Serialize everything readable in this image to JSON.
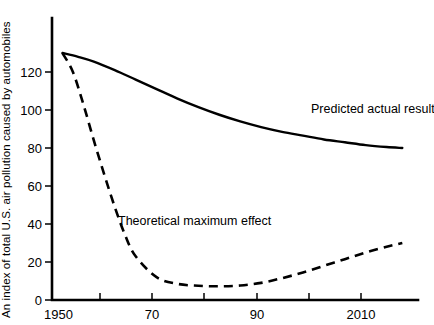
{
  "chart_data": {
    "type": "line",
    "title": "",
    "xlabel": "",
    "ylabel": "An index of total U.S. air pollution caused by automobiles",
    "xlim": [
      1950,
      2020
    ],
    "ylim": [
      0,
      140
    ],
    "grid": false,
    "legend_position": "inline-annotation",
    "x_ticks": [
      {
        "value": 1950,
        "label": "1950"
      },
      {
        "value": 1960,
        "label": ""
      },
      {
        "value": 1970,
        "label": "70"
      },
      {
        "value": 1980,
        "label": ""
      },
      {
        "value": 1990,
        "label": "90"
      },
      {
        "value": 2000,
        "label": ""
      },
      {
        "value": 2010,
        "label": "2010"
      }
    ],
    "y_ticks": [
      {
        "value": 0,
        "label": "0"
      },
      {
        "value": 20,
        "label": "20"
      },
      {
        "value": 40,
        "label": "40"
      },
      {
        "value": 60,
        "label": "60"
      },
      {
        "value": 80,
        "label": "80"
      },
      {
        "value": 100,
        "label": "100"
      },
      {
        "value": 120,
        "label": "120"
      }
    ],
    "series": [
      {
        "name": "Predicted actual result",
        "style": "solid",
        "color": "#000000",
        "annotation": "Predicted actual result",
        "annotation_x": 1997,
        "annotation_y": 99,
        "x": [
          1952,
          1955,
          1958,
          1962,
          1966,
          1970,
          1974,
          1978,
          1982,
          1986,
          1990,
          1994,
          1998,
          2002,
          2006,
          2010,
          2014,
          2017
        ],
        "y": [
          130,
          128,
          125.5,
          121,
          116,
          111,
          106,
          101.5,
          97.5,
          94,
          91,
          88.5,
          86.5,
          84.5,
          83,
          81.5,
          80.5,
          80
        ]
      },
      {
        "name": "Theoretical maximum effect",
        "style": "dashed",
        "color": "#000000",
        "annotation": "Theoretical maximum effect",
        "annotation_x": 1973,
        "annotation_y": 36,
        "x": [
          1952,
          1954,
          1956,
          1958,
          1960,
          1962,
          1964,
          1966,
          1970,
          1974,
          1978,
          1982,
          1986,
          1990,
          1994,
          1998,
          2002,
          2006,
          2010,
          2014,
          2017
        ],
        "y": [
          130,
          120,
          103,
          84,
          66,
          49,
          34,
          23,
          12,
          8.5,
          7.5,
          7.2,
          7.6,
          9,
          11.5,
          14.5,
          18,
          21.5,
          25,
          28,
          30
        ]
      }
    ]
  }
}
